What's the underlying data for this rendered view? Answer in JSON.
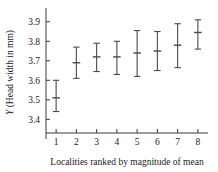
{
  "chart_data": {
    "type": "scatter",
    "title": "",
    "xlabel": "Localities ranked by magnitude of mean",
    "ylabel": "Y (Head width in mm)",
    "ylabel_italic_prefix": "Y",
    "ylabel_rest": " (Head width in mm)",
    "categories": [
      "1",
      "2",
      "3",
      "4",
      "5",
      "6",
      "7",
      "8"
    ],
    "ytick_labels": [
      "3.4",
      "3.5",
      "3.6",
      "3.7",
      "3.8",
      "3.9"
    ],
    "ytick_values": [
      3.4,
      3.5,
      3.6,
      3.7,
      3.8,
      3.9
    ],
    "ylim": [
      3.33,
      3.95
    ],
    "xlim": [
      0.5,
      8.5
    ],
    "grid": false,
    "legend": null,
    "series": [
      {
        "name": "mean with error bars",
        "means": [
          3.51,
          3.69,
          3.72,
          3.72,
          3.74,
          3.75,
          3.78,
          3.845
        ],
        "lower": [
          3.44,
          3.61,
          3.645,
          3.63,
          3.62,
          3.65,
          3.665,
          3.76
        ],
        "upper": [
          3.6,
          3.77,
          3.79,
          3.8,
          3.855,
          3.85,
          3.89,
          3.91
        ]
      }
    ],
    "points": [
      {
        "x": "1",
        "mean": 3.51,
        "lower": 3.44,
        "upper": 3.6
      },
      {
        "x": "2",
        "mean": 3.69,
        "lower": 3.61,
        "upper": 3.77
      },
      {
        "x": "3",
        "mean": 3.72,
        "lower": 3.645,
        "upper": 3.79
      },
      {
        "x": "4",
        "mean": 3.72,
        "lower": 3.63,
        "upper": 3.8
      },
      {
        "x": "5",
        "mean": 3.74,
        "lower": 3.62,
        "upper": 3.855
      },
      {
        "x": "6",
        "mean": 3.75,
        "lower": 3.65,
        "upper": 3.85
      },
      {
        "x": "7",
        "mean": 3.78,
        "lower": 3.665,
        "upper": 3.89
      },
      {
        "x": "8",
        "mean": 3.845,
        "lower": 3.76,
        "upper": 3.91
      }
    ]
  },
  "colors": {
    "background": "#ffffff",
    "axis": "#3a3a3a",
    "marker": "#4a4a4a",
    "text": "#1a1a1a"
  }
}
